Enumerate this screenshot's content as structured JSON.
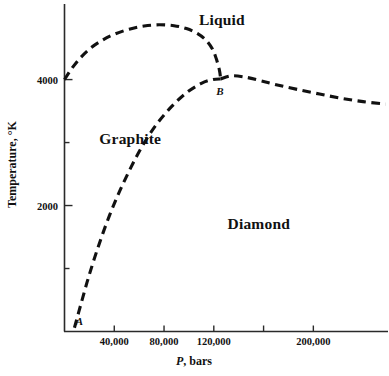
{
  "chart_data": {
    "type": "line",
    "title": "",
    "xlabel": "P, bars",
    "ylabel": "Temperature, °K",
    "xlim": [
      0,
      260000
    ],
    "ylim": [
      0,
      5200
    ],
    "grid": false,
    "legend": "none",
    "x_ticks": [
      {
        "value": 40000,
        "label": "40,000"
      },
      {
        "value": 80000,
        "label": "80,000"
      },
      {
        "value": 120000,
        "label": "120,000"
      },
      {
        "value": 160000,
        "label": ""
      },
      {
        "value": 200000,
        "label": "200,000"
      }
    ],
    "y_ticks": [
      {
        "value": 1000,
        "label": ""
      },
      {
        "value": 2000,
        "label": "2000"
      },
      {
        "value": 3000,
        "label": ""
      },
      {
        "value": 4000,
        "label": "4000"
      }
    ],
    "region_labels": [
      {
        "name": "liquid",
        "text": "Liquid",
        "x": 108000,
        "y": 4960
      },
      {
        "name": "graphite",
        "text": "Graphite",
        "x": 28000,
        "y": 3080
      },
      {
        "name": "diamond",
        "text": "Diamond",
        "x": 131000,
        "y": 1720
      }
    ],
    "point_labels": [
      {
        "name": "point-a",
        "text": "A",
        "x": 9000,
        "y": 170
      },
      {
        "name": "point-b",
        "text": "B",
        "x": 122000,
        "y": 3830
      }
    ],
    "series": [
      {
        "name": "graphite-melting-curve",
        "style": "dashed",
        "points": [
          [
            0,
            4000
          ],
          [
            6000,
            4180
          ],
          [
            13000,
            4350
          ],
          [
            21000,
            4500
          ],
          [
            30000,
            4620
          ],
          [
            40000,
            4720
          ],
          [
            52000,
            4800
          ],
          [
            64000,
            4850
          ],
          [
            76000,
            4870
          ],
          [
            88000,
            4855
          ],
          [
            98000,
            4810
          ],
          [
            107000,
            4730
          ],
          [
            114000,
            4620
          ],
          [
            119000,
            4480
          ],
          [
            122000,
            4330
          ],
          [
            124500,
            4150
          ],
          [
            125500,
            4010
          ]
        ]
      },
      {
        "name": "diamond-melting-curve",
        "style": "dashed",
        "points": [
          [
            125500,
            4010
          ],
          [
            134000,
            4060
          ],
          [
            145000,
            4040
          ],
          [
            158000,
            3980
          ],
          [
            172000,
            3910
          ],
          [
            188000,
            3840
          ],
          [
            205000,
            3770
          ],
          [
            222000,
            3705
          ],
          [
            240000,
            3650
          ],
          [
            258000,
            3610
          ]
        ]
      },
      {
        "name": "graphite-diamond-boundary",
        "style": "dashed",
        "points": [
          [
            8000,
            60
          ],
          [
            13000,
            420
          ],
          [
            19000,
            840
          ],
          [
            26000,
            1280
          ],
          [
            34000,
            1730
          ],
          [
            43000,
            2170
          ],
          [
            53000,
            2590
          ],
          [
            63000,
            2960
          ],
          [
            74000,
            3290
          ],
          [
            86000,
            3570
          ],
          [
            98000,
            3790
          ],
          [
            110000,
            3940
          ],
          [
            119000,
            4000
          ],
          [
            125500,
            4010
          ]
        ]
      }
    ]
  },
  "axes": {
    "x_title_italic": "P",
    "x_title_rest": ", bars",
    "y_title": "Temperature, °K"
  },
  "colors": {
    "line": "#111111",
    "axis": "#2a2a2a",
    "background": "#ffffff"
  }
}
